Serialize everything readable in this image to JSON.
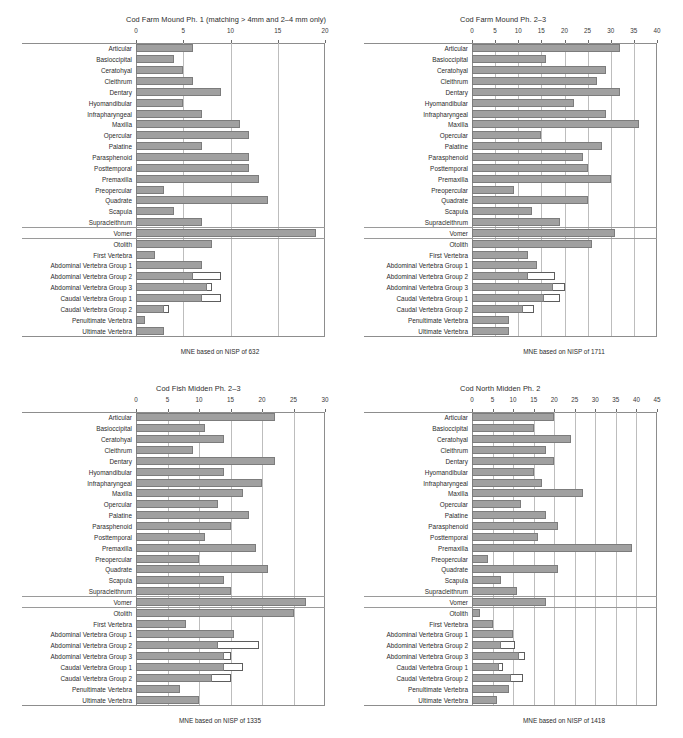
{
  "figure": {
    "categories": [
      "Articular",
      "Basioccipital",
      "Ceratohyal",
      "Cleithrum",
      "Dentary",
      "Hyomandibular",
      "Infrapharyngeal",
      "Maxilla",
      "Opercular",
      "Palatine",
      "Parasphenoid",
      "Posttemporal",
      "Premaxilla",
      "Preopercular",
      "Quadrate",
      "Scapula",
      "Supracleithrum",
      "Vomer",
      "Otolith",
      "First Vertebra",
      "Abdominal Vertebra Group 1",
      "Abdominal Vertebra Group 2",
      "Abdominal Vertebra Group 3",
      "Caudal Vertebra Group 1",
      "Caudal Vertebra Group 2",
      "Penultimate Vertebra",
      "Ultimate Vertebra"
    ]
  },
  "chart_data": [
    {
      "type": "bar",
      "panel": "top-left",
      "title": "Cod Farm Mound Ph. 1 (matching > 4mm and 2–4 mm only)",
      "footer": "MNE based on NISP of 632",
      "xlabel": "",
      "ylabel": "",
      "xlim": [
        0,
        20
      ],
      "xticks": [
        0,
        5,
        10,
        15,
        20
      ],
      "xticklabels": [
        "0",
        "5",
        "10",
        "15",
        "20"
      ],
      "grid": true,
      "orientation": "horizontal",
      "categories": [
        "Articular",
        "Basioccipital",
        "Ceratohyal",
        "Cleithrum",
        "Dentary",
        "Hyomandibular",
        "Infrapharyngeal",
        "Maxilla",
        "Opercular",
        "Palatine",
        "Parasphenoid",
        "Posttemporal",
        "Premaxilla",
        "Preopercular",
        "Quadrate",
        "Scapula",
        "Supracleithrum",
        "Vomer",
        "Otolith",
        "First Vertebra",
        "Abdominal Vertebra Group 1",
        "Abdominal Vertebra Group 2",
        "Abdominal Vertebra Group 3",
        "Caudal Vertebra Group 1",
        "Caudal Vertebra Group 2",
        "Penultimate Vertebra",
        "Ultimate Vertebra"
      ],
      "series": [
        {
          "name": "MNE (filled)",
          "color": "#a0a0a0",
          "values": [
            6,
            4,
            5,
            6,
            9,
            5,
            7,
            11,
            12,
            7,
            12,
            12,
            13,
            3,
            14,
            4,
            7,
            19,
            8,
            2,
            7,
            6,
            7.5,
            7,
            3,
            1,
            3
          ]
        },
        {
          "name": "Extension (outline)",
          "color": "#ffffff",
          "values": [
            0,
            0,
            0,
            0,
            0,
            0,
            0,
            0,
            0,
            0,
            0,
            0,
            0,
            0,
            0,
            0,
            0,
            0,
            0,
            0,
            0,
            9,
            8,
            9,
            3.5,
            0,
            0
          ]
        }
      ]
    },
    {
      "type": "bar",
      "panel": "top-right",
      "title": "Cod Farm Mound Ph. 2–3",
      "footer": "MNE based on NISP of 1711",
      "xlabel": "",
      "ylabel": "",
      "xlim": [
        0,
        40
      ],
      "xticks": [
        0,
        5,
        10,
        15,
        20,
        25,
        30,
        35,
        40
      ],
      "xticklabels": [
        "0",
        "5",
        "10",
        "15",
        "20",
        "25",
        "30",
        "35",
        "40"
      ],
      "grid": true,
      "orientation": "horizontal",
      "categories": [
        "Articular",
        "Basioccipital",
        "Ceratohyal",
        "Cleithrum",
        "Dentary",
        "Hyomandibular",
        "Infrapharyngeal",
        "Maxilla",
        "Opercular",
        "Palatine",
        "Parasphenoid",
        "Posttemporal",
        "Premaxilla",
        "Preopercular",
        "Quadrate",
        "Scapula",
        "Supracleithrum",
        "Vomer",
        "Otolith",
        "First Vertebra",
        "Abdominal Vertebra Group 1",
        "Abdominal Vertebra Group 2",
        "Abdominal Vertebra Group 3",
        "Caudal Vertebra Group 1",
        "Caudal Vertebra Group 2",
        "Penultimate Vertebra",
        "Ultimate Vertebra"
      ],
      "series": [
        {
          "name": "MNE (filled)",
          "color": "#a0a0a0",
          "values": [
            32,
            16,
            29,
            27,
            32,
            22,
            29,
            36,
            15,
            28,
            24,
            25,
            30,
            9,
            25,
            13,
            19,
            31,
            26,
            12,
            14,
            12,
            17.5,
            15.5,
            11,
            8,
            8
          ]
        },
        {
          "name": "Extension (outline)",
          "color": "#ffffff",
          "values": [
            0,
            0,
            0,
            0,
            0,
            0,
            0,
            0,
            0,
            0,
            0,
            0,
            0,
            0,
            0,
            0,
            0,
            0,
            0,
            0,
            0,
            18,
            20,
            19,
            13.5,
            0,
            0
          ]
        }
      ]
    },
    {
      "type": "bar",
      "panel": "bottom-left",
      "title": "Cod Fish Midden Ph. 2–3",
      "footer": "MNE based on NISP of 1335",
      "xlabel": "",
      "ylabel": "",
      "xlim": [
        0,
        30
      ],
      "xticks": [
        0,
        5,
        10,
        15,
        20,
        25,
        30
      ],
      "xticklabels": [
        "0",
        "5",
        "10",
        "15",
        "20",
        "25",
        "30"
      ],
      "grid": true,
      "orientation": "horizontal",
      "categories": [
        "Articular",
        "Basioccipital",
        "Ceratohyal",
        "Cleithrum",
        "Dentary",
        "Hyomandibular",
        "Infrapharyngeal",
        "Maxilla",
        "Opercular",
        "Palatine",
        "Parasphenoid",
        "Posttemporal",
        "Premaxilla",
        "Preopercular",
        "Quadrate",
        "Scapula",
        "Supracleithrum",
        "Vomer",
        "Otolith",
        "First Vertebra",
        "Abdominal Vertebra Group 1",
        "Abdominal Vertebra Group 2",
        "Abdominal Vertebra Group 3",
        "Caudal Vertebra Group 1",
        "Caudal Vertebra Group 2",
        "Penultimate Vertebra",
        "Ultimate Vertebra"
      ],
      "series": [
        {
          "name": "MNE (filled)",
          "color": "#a0a0a0",
          "values": [
            22,
            11,
            14,
            9,
            22,
            14,
            20,
            17,
            13,
            18,
            15,
            11,
            19,
            10,
            21,
            14,
            15,
            27,
            25,
            8,
            15.5,
            13,
            14,
            14,
            12,
            7,
            10
          ]
        },
        {
          "name": "Extension (outline)",
          "color": "#ffffff",
          "values": [
            0,
            0,
            0,
            0,
            0,
            0,
            0,
            0,
            0,
            0,
            0,
            0,
            0,
            0,
            0,
            0,
            0,
            0,
            0,
            0,
            0,
            19.5,
            15,
            17,
            15,
            0,
            0
          ]
        }
      ]
    },
    {
      "type": "bar",
      "panel": "bottom-right",
      "title": "Cod North Midden Ph. 2",
      "footer": "MNE based on NISP of 1418",
      "xlabel": "",
      "ylabel": "",
      "xlim": [
        0,
        45
      ],
      "xticks": [
        0,
        5,
        10,
        15,
        20,
        25,
        30,
        35,
        40,
        45
      ],
      "xticklabels": [
        "0",
        "5",
        "10",
        "15",
        "20",
        "25",
        "30",
        "35",
        "40",
        "45"
      ],
      "grid": true,
      "orientation": "horizontal",
      "categories": [
        "Articular",
        "Basioccipital",
        "Ceratohyal",
        "Cleithrum",
        "Dentary",
        "Hyomandibular",
        "Infrapharyngeal",
        "Maxilla",
        "Opercular",
        "Palatine",
        "Parasphenoid",
        "Posttemporal",
        "Premaxilla",
        "Preopercular",
        "Quadrate",
        "Scapula",
        "Supracleithrum",
        "Vomer",
        "Otolith",
        "First Vertebra",
        "Abdominal Vertebra Group 1",
        "Abdominal Vertebra Group 2",
        "Abdominal Vertebra Group 3",
        "Caudal Vertebra Group 1",
        "Caudal Vertebra Group 2",
        "Penultimate Vertebra",
        "Ultimate Vertebra"
      ],
      "series": [
        {
          "name": "MNE (filled)",
          "color": "#a0a0a0",
          "values": [
            20,
            15,
            24,
            18,
            20,
            15,
            17,
            27,
            12,
            18,
            21,
            16,
            39,
            4,
            21,
            7,
            11,
            18,
            2,
            5,
            10,
            7,
            11.5,
            6.5,
            9.5,
            9,
            6
          ]
        },
        {
          "name": "Extension (outline)",
          "color": "#ffffff",
          "values": [
            0,
            0,
            0,
            0,
            0,
            0,
            0,
            0,
            0,
            0,
            0,
            0,
            0,
            0,
            0,
            0,
            0,
            0,
            0,
            0,
            0,
            10.5,
            13,
            7.5,
            12.5,
            0,
            0
          ]
        }
      ]
    }
  ]
}
